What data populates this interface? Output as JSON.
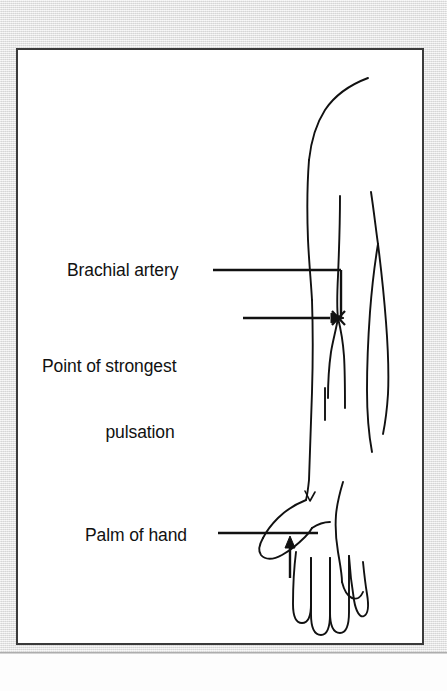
{
  "figure": {
    "type": "medical-line-illustration",
    "background_color": "#e9e9e9",
    "panel_color": "#ffffff",
    "ink_color": "#111111",
    "border_color": "#3a3a3a"
  },
  "annotations": {
    "brachial_artery": {
      "label": "Brachial artery",
      "leader": "horizontal-line-then-vertical-drop",
      "target": "brachial artery along inner upper arm"
    },
    "point_of_strongest_pulsation": {
      "label_line1": "Point of strongest",
      "label_line2": "pulsation",
      "leader": "horizontal-arrow",
      "marker": "x-marker",
      "marker_glyph": "✕",
      "target": "antecubital fossa pulse point"
    },
    "palm_of_hand": {
      "label": "Palm of hand",
      "leader": "horizontal-line-then-up-arrow",
      "target": "palm surface of hand"
    }
  },
  "anatomy_parts": [
    "shoulder",
    "upper arm",
    "elbow",
    "brachial artery",
    "forearm",
    "wrist",
    "palm of hand",
    "thumb",
    "fingers"
  ]
}
